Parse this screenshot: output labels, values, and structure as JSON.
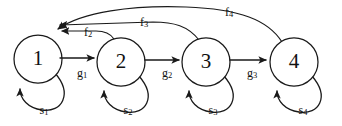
{
  "diagram": {
    "background_color": "#ffffff",
    "stroke_color": "#1a1a1a",
    "nodes": [
      {
        "id": "1",
        "label": "1",
        "cx": 38,
        "cy": 59,
        "r": 24
      },
      {
        "id": "2",
        "label": "2",
        "cx": 121,
        "cy": 62,
        "r": 24
      },
      {
        "id": "3",
        "label": "3",
        "cx": 206,
        "cy": 62,
        "r": 24
      },
      {
        "id": "4",
        "label": "4",
        "cx": 294,
        "cy": 62,
        "r": 24
      }
    ],
    "forward_edges": [
      {
        "id": "g1",
        "from": "1",
        "to": "2",
        "base": "g",
        "sub": "1",
        "lx": 82,
        "ly": 74
      },
      {
        "id": "g2",
        "from": "2",
        "to": "3",
        "base": "g",
        "sub": "2",
        "lx": 167,
        "ly": 74
      },
      {
        "id": "g3",
        "from": "3",
        "to": "4",
        "base": "g",
        "sub": "3",
        "lx": 252,
        "ly": 74
      }
    ],
    "self_loops": [
      {
        "id": "s1",
        "node": "1",
        "base": "s",
        "sub": "1",
        "lx": 44,
        "ly": 111
      },
      {
        "id": "s2",
        "node": "2",
        "base": "s",
        "sub": "2",
        "lx": 128,
        "ly": 111
      },
      {
        "id": "s3",
        "node": "3",
        "base": "s",
        "sub": "3",
        "lx": 213,
        "ly": 111
      },
      {
        "id": "s4",
        "node": "4",
        "base": "s",
        "sub": "4",
        "lx": 303,
        "ly": 111
      }
    ],
    "feedback_edges": [
      {
        "id": "f2",
        "from": "2",
        "to": "1",
        "base": "f",
        "sub": "2",
        "lx": 88,
        "ly": 33
      },
      {
        "id": "f3",
        "from": "3",
        "to": "1",
        "base": "f",
        "sub": "3",
        "lx": 144,
        "ly": 23
      },
      {
        "id": "f4",
        "from": "4",
        "to": "1",
        "base": "f",
        "sub": "4",
        "lx": 229,
        "ly": 13
      }
    ]
  }
}
